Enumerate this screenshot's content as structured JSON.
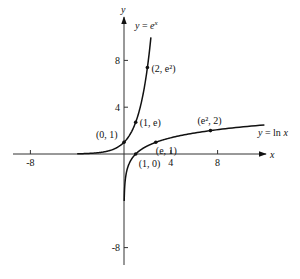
{
  "chart_data": {
    "type": "line",
    "title": "",
    "xlabel": "x",
    "ylabel": "y",
    "xlim": [
      -10,
      12
    ],
    "ylim": [
      -10,
      10.5
    ],
    "x_ticks": [
      -8,
      4,
      8
    ],
    "y_ticks": [
      -8,
      4,
      8
    ],
    "x_tick_labels": [
      "-8",
      "4",
      "8"
    ],
    "y_tick_labels": [
      "-8",
      "4",
      "8"
    ],
    "grid": false,
    "series": [
      {
        "name": "y = e^x",
        "label": "y = e",
        "label_sup": "x",
        "function": "exp",
        "domain": [
          -4,
          2.3
        ]
      },
      {
        "name": "y = ln x",
        "label": "y = ln x",
        "function": "ln",
        "domain": [
          0.018,
          12
        ]
      }
    ],
    "points": [
      {
        "x": 0,
        "y": 1,
        "label": "(0, 1)",
        "series": "y = e^x"
      },
      {
        "x": 1,
        "y": 2.718,
        "label": "(1, e)",
        "series": "y = e^x"
      },
      {
        "x": 2,
        "y": 7.389,
        "label": "(2, e²)",
        "series": "y = e^x"
      },
      {
        "x": 1,
        "y": 0,
        "label": "(1, 0)",
        "series": "y = ln x"
      },
      {
        "x": 2.718,
        "y": 1,
        "label": "(e, 1)",
        "series": "y = ln x"
      },
      {
        "x": 7.389,
        "y": 2,
        "label": "(e², 2)",
        "series": "y = ln x"
      }
    ]
  }
}
